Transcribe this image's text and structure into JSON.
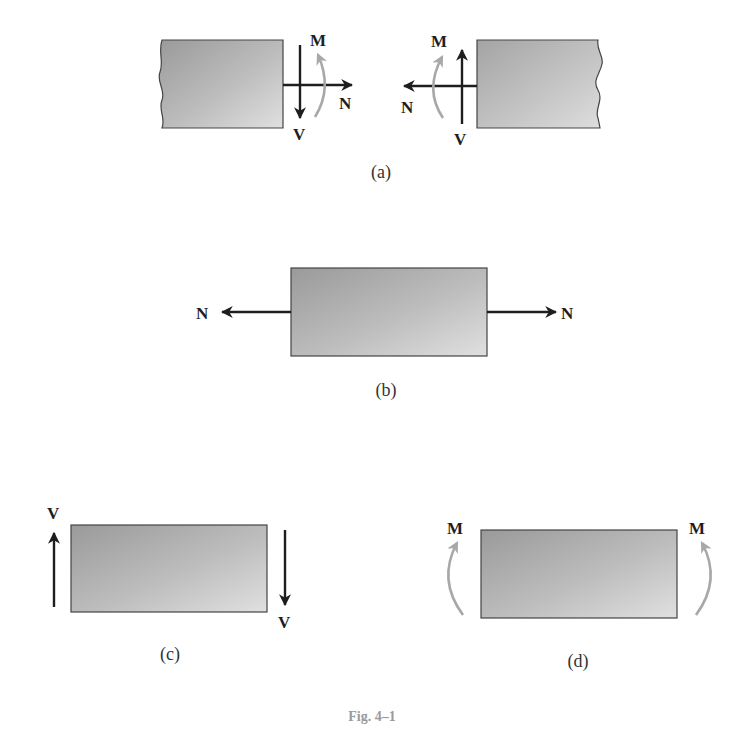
{
  "figure": {
    "caption": "Fig. 4–1",
    "colors": {
      "arrow": "#1e1e1e",
      "moment_arrow": "#a8a8a8",
      "block_dark": "#9c9c9c",
      "block_light": "#dcdcdc",
      "block_border": "#444444",
      "caption": "#9a9a9a"
    },
    "panels": [
      {
        "id": "a",
        "label": "(a)",
        "description": "Sectioned member showing internal resultants",
        "left_segment": {
          "labels": {
            "moment": "M",
            "normal": "N",
            "shear": "V"
          }
        },
        "right_segment": {
          "labels": {
            "moment": "M",
            "normal": "N",
            "shear": "V"
          }
        }
      },
      {
        "id": "b",
        "label": "(b)",
        "description": "Normal force",
        "labels": {
          "left": "N",
          "right": "N"
        }
      },
      {
        "id": "c",
        "label": "(c)",
        "description": "Shear force",
        "labels": {
          "left": "V",
          "right": "V"
        }
      },
      {
        "id": "d",
        "label": "(d)",
        "description": "Bending moment",
        "labels": {
          "left": "M",
          "right": "M"
        }
      }
    ]
  }
}
